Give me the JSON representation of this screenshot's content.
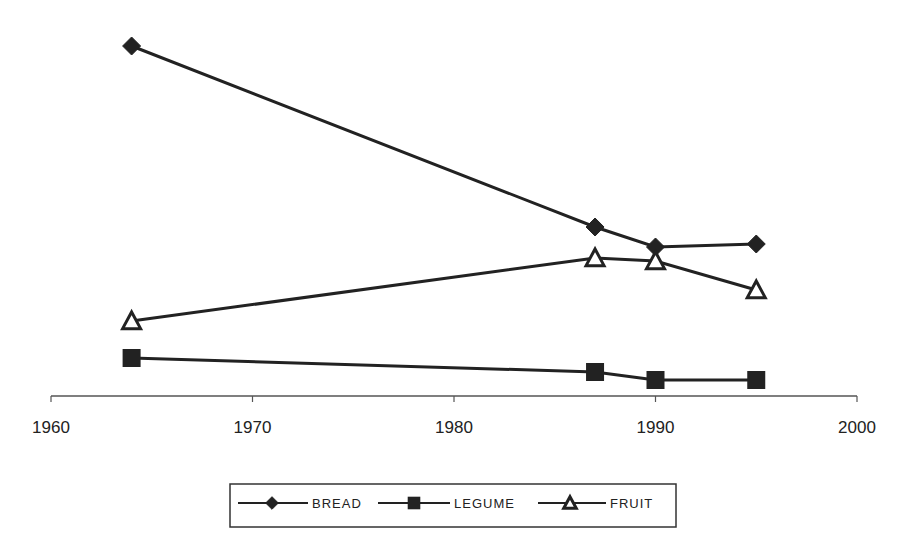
{
  "chart_data": {
    "type": "line",
    "title": "",
    "xlabel": "",
    "ylabel": "",
    "xlim": [
      1960,
      2000
    ],
    "xticks": [
      1960,
      1970,
      1980,
      1990,
      2000
    ],
    "y_axis_visible": false,
    "y_units_note": "no y-axis shown; values are relative heights above x-axis (px)",
    "grid": false,
    "legend_position": "bottom",
    "x": [
      1964,
      1987,
      1990,
      1995
    ],
    "series": [
      {
        "name": "BREAD",
        "marker": "diamond",
        "filled": true,
        "values": [
          350,
          169,
          149,
          152
        ]
      },
      {
        "name": "LEGUME",
        "marker": "square",
        "filled": true,
        "values": [
          38,
          24,
          16,
          16
        ]
      },
      {
        "name": "FRUIT",
        "marker": "triangle",
        "filled": false,
        "values": [
          75,
          138,
          135,
          106
        ]
      }
    ]
  },
  "colors": {
    "line": "#222222",
    "background": "#ffffff"
  },
  "legend": {
    "items": [
      "BREAD",
      "LEGUME",
      "FRUIT"
    ]
  },
  "axis": {
    "tick_labels": [
      "1960",
      "1970",
      "1980",
      "1990",
      "2000"
    ]
  }
}
